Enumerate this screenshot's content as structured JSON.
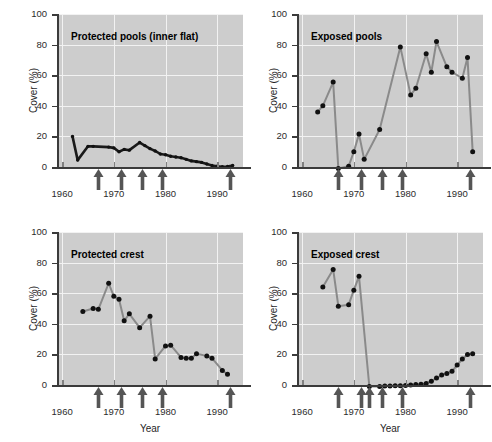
{
  "figure": {
    "width": 492,
    "height": 442,
    "background": "#ffffff",
    "panel_background": "#cdcdcd",
    "gridline_color": "#f2f2f2",
    "axis_color": "#3b3b3b",
    "marker_color": "#111111",
    "line_color_dark": "#1a1a1a",
    "line_color_gray": "#8a8a8a",
    "arrow_color": "#555555"
  },
  "axis_titles": {
    "y": "Cover (%)",
    "x": "Year"
  },
  "y_ticks": [
    "0",
    "20",
    "40",
    "60",
    "80",
    "100"
  ],
  "x_ticks": [
    "1960",
    "1970",
    "1980",
    "1990"
  ],
  "chart_data": [
    {
      "type": "line",
      "title": "Protected pools (inner flat)",
      "panel": "top-left",
      "xlabel": "Year",
      "ylabel": "Cover (%)",
      "xlim": [
        1959,
        1995
      ],
      "ylim": [
        0,
        100
      ],
      "grid": true,
      "legend_position": "none",
      "line_style": "dark-thick",
      "x": [
        1962,
        1963,
        1965,
        1966,
        1969,
        1970,
        1971,
        1972,
        1973,
        1975,
        1976,
        1977,
        1978,
        1979,
        1980,
        1981,
        1982,
        1983,
        1984,
        1985,
        1986,
        1987,
        1988,
        1989,
        1990,
        1991,
        1992,
        1993
      ],
      "y": [
        20.0,
        4.5,
        13.5,
        13.5,
        13.0,
        12.5,
        10.0,
        11.5,
        11.0,
        16.0,
        14.0,
        12.0,
        10.5,
        8.5,
        8.0,
        7.0,
        6.5,
        6.0,
        5.0,
        4.0,
        3.5,
        3.0,
        2.0,
        1.0,
        0.5,
        0.2,
        0.3,
        1.0
      ],
      "event_arrows": [
        1967,
        1971.5,
        1975.5,
        1979.5,
        1992.5
      ]
    },
    {
      "type": "line",
      "title": "Exposed pools",
      "panel": "top-right",
      "xlabel": "Year",
      "ylabel": "Cover (%)",
      "xlim": [
        1959,
        1995
      ],
      "ylim": [
        0,
        100
      ],
      "grid": true,
      "legend_position": "none",
      "line_style": "gray-thick",
      "x": [
        1963,
        1964,
        1966,
        1967,
        1969,
        1970,
        1971,
        1972,
        1975,
        1979,
        1981,
        1982,
        1984,
        1985,
        1986,
        1988,
        1989,
        1991,
        1992,
        1993
      ],
      "y": [
        36.0,
        40.0,
        55.5,
        -1.0,
        0.5,
        10.0,
        21.5,
        5.0,
        24.5,
        78.5,
        47.0,
        51.5,
        74.0,
        62.0,
        82.0,
        65.5,
        62.0,
        58.0,
        71.5,
        10.0
      ],
      "event_arrows": [
        1967,
        1971.5,
        1975.5,
        1979.5,
        1992.5
      ]
    },
    {
      "type": "line",
      "title": "Protected crest",
      "panel": "bottom-left",
      "xlabel": "Year",
      "ylabel": "Cover (%)",
      "xlim": [
        1959,
        1995
      ],
      "ylim": [
        0,
        100
      ],
      "grid": true,
      "legend_position": "none",
      "line_style": "gray-thick",
      "x": [
        1964,
        1966,
        1967,
        1969,
        1970,
        1971,
        1972,
        1973,
        1975,
        1977,
        1978,
        1980,
        1981,
        1983,
        1984,
        1985,
        1986,
        1988,
        1989,
        1991,
        1992
      ],
      "y": [
        48.0,
        50.0,
        49.5,
        66.5,
        58.0,
        56.0,
        42.0,
        46.5,
        37.5,
        45.0,
        17.0,
        25.5,
        26.0,
        18.0,
        17.5,
        17.5,
        20.5,
        19.0,
        17.5,
        9.5,
        7.0
      ],
      "event_arrows": [
        1967,
        1971.5,
        1975.5,
        1979.5,
        1992.5
      ]
    },
    {
      "type": "line",
      "title": "Exposed crest",
      "panel": "bottom-right",
      "xlabel": "Year",
      "ylabel": "Cover (%)",
      "xlim": [
        1959,
        1995
      ],
      "ylim": [
        0,
        100
      ],
      "grid": true,
      "legend_position": "none",
      "line_style": "gray-thick",
      "x": [
        1964,
        1966,
        1967,
        1969,
        1970,
        1971,
        1973,
        1975,
        1976,
        1977,
        1978,
        1979,
        1980,
        1981,
        1982,
        1983,
        1984,
        1985,
        1986,
        1987,
        1988,
        1989,
        1990,
        1991,
        1992,
        1993
      ],
      "y": [
        64.0,
        75.5,
        51.5,
        52.5,
        62.0,
        71.0,
        -1.0,
        -1.0,
        -0.7,
        -0.7,
        -0.5,
        -0.5,
        -0.3,
        0.0,
        0.3,
        0.5,
        1.0,
        2.5,
        4.5,
        6.5,
        7.5,
        9.0,
        13.0,
        17.0,
        20.0,
        20.5
      ],
      "event_arrows": [
        1967,
        1971.5,
        1973.0,
        1975.5,
        1979.5,
        1992.5
      ]
    }
  ]
}
